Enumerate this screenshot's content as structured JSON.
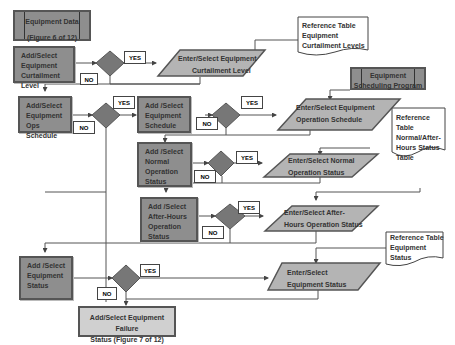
{
  "diagram": {
    "type": "flowchart",
    "colors": {
      "process_fill": "#8e8e8e",
      "io_fill": "#b4b4b4",
      "decision_fill": "#777777",
      "border": "#555555"
    },
    "nodes": {
      "equipment_data": {
        "line1": "Equipment Data",
        "line2": "(Figure 6 of 12)"
      },
      "add_curtailment": {
        "line1": "Add/Select",
        "line2": "Equipment",
        "line3": "Curtailment Level"
      },
      "enter_curtailment": {
        "line1": "Enter/Select Equipment",
        "line2": "Curtailment Level"
      },
      "ref_curtailment": {
        "line1": "Reference Table",
        "line2": "Equipment",
        "line3": "Curtailment Levels"
      },
      "add_ops_schedule": {
        "line1": "Add/Select",
        "line2": "Equipment Ops",
        "line3": "Schedule"
      },
      "add_equipment_schedule": {
        "line1": "Add /Select",
        "line2": "Equipment",
        "line3": "Schedule"
      },
      "scheduling_program": {
        "line1": "Equipment",
        "line2": "Scheduling Program"
      },
      "enter_operation_schedule": {
        "line1": "Enter/Select Equipment",
        "line2": "Operation Schedule"
      },
      "add_normal_status": {
        "line1": "Add /Select",
        "line2": "Normal",
        "line3": "Operation",
        "line4": "Status"
      },
      "enter_normal_status": {
        "line1": "Enter/Select Normal",
        "line2": "Operation Status"
      },
      "ref_normal_afterhours": {
        "line1": "Reference",
        "line2": "Table",
        "line3": "Normal/After-",
        "line4": "Hours Status",
        "line5": "Table"
      },
      "add_afterhours_status": {
        "line1": "Add /Select",
        "line2": "After-Hours",
        "line3": "Operation",
        "line4": "Status"
      },
      "enter_afterhours_status": {
        "line1": "Enter/Select After-",
        "line2": "Hours Operation Status"
      },
      "ref_equipment_status": {
        "line1": "Reference Table",
        "line2": "Equipment",
        "line3": "Status"
      },
      "add_equipment_status": {
        "line1": "Add /Select",
        "line2": "Equipment",
        "line3": "Status"
      },
      "enter_equipment_status": {
        "line1": "Enter/Select",
        "line2": "Equipment Status"
      },
      "failure_status": {
        "line1": "Add/Select Equipment Failure",
        "line2": "Status (Figure 7 of 12)"
      }
    },
    "labels": {
      "yes": "YES",
      "no": "NO"
    }
  }
}
